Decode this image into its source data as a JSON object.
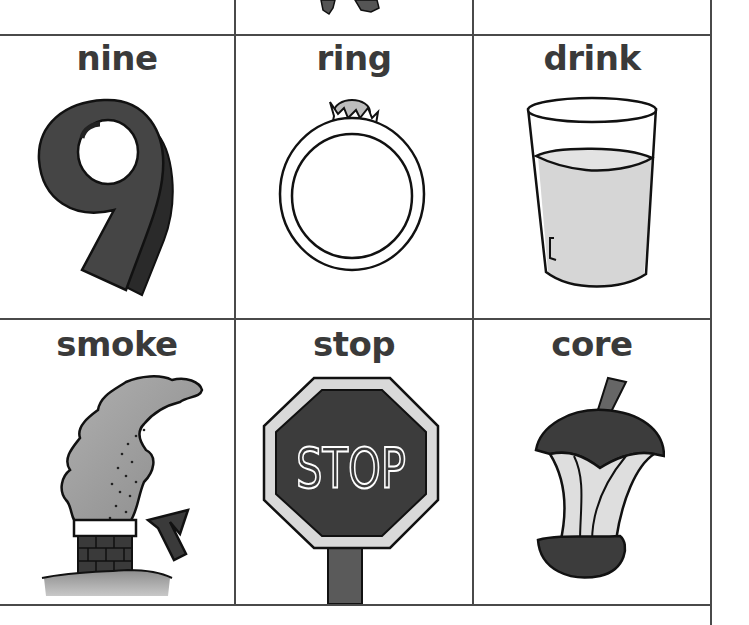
{
  "worksheet": {
    "top_row_fragment": {
      "icon": "cropped-illustration-fragment"
    },
    "cards": [
      {
        "word": "nine",
        "icon": "number-nine-icon"
      },
      {
        "word": "ring",
        "icon": "ring-icon"
      },
      {
        "word": "drink",
        "icon": "glass-of-drink-icon"
      },
      {
        "word": "smoke",
        "icon": "chimney-smoke-icon"
      },
      {
        "word": "stop",
        "icon": "stop-sign-icon",
        "sign_text": "STOP"
      },
      {
        "word": "core",
        "icon": "apple-core-icon"
      }
    ]
  },
  "colors": {
    "grid_line": "#4a4a4a",
    "text": "#3a3a3a",
    "dark_fill": "#3f3f3f",
    "light_fill": "#d6d6d6",
    "outline": "#111111"
  }
}
